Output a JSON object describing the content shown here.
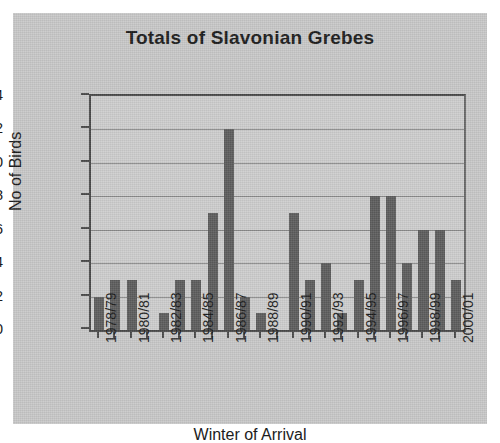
{
  "chart_data": {
    "type": "bar",
    "title": "Totals of Slavonian Grebes",
    "xlabel": "Winter of Arrival",
    "ylabel": "No of Birds",
    "ylim": [
      0,
      14
    ],
    "yticks": [
      0,
      2,
      4,
      6,
      8,
      10,
      12,
      14
    ],
    "grid": true,
    "legend": "none",
    "bar_color": "#5d5d5d",
    "plot_background": "#cecece",
    "page_background": "#c9c9c9",
    "axis_color": "#4a4a4a",
    "categories": [
      "1978/79",
      "1979/80",
      "1980/81",
      "1981/82",
      "1982/83",
      "1983/84",
      "1984/85",
      "1985/86",
      "1986/87",
      "1987/88",
      "1988/89",
      "1989/90",
      "1990/91",
      "1991/92",
      "1992/93",
      "1993/94",
      "1994/95",
      "1995/96",
      "1996/97",
      "1997/98",
      "1998/99",
      "1999/00",
      "2000/01"
    ],
    "values": [
      2,
      3,
      3,
      0,
      1,
      3,
      3,
      7,
      12,
      2,
      1,
      0,
      7,
      3,
      4,
      1,
      3,
      8,
      8,
      4,
      6,
      6,
      3
    ],
    "visible_tick_labels": [
      "1978/79",
      "1980/81",
      "1982/83",
      "1984/85",
      "1986/87",
      "1988/89",
      "1990/91",
      "1992/93",
      "1994/95",
      "1996/97",
      "1998/99",
      "2000/01"
    ],
    "visible_tick_indices": [
      0,
      2,
      4,
      6,
      8,
      10,
      12,
      14,
      16,
      18,
      20,
      22
    ]
  }
}
